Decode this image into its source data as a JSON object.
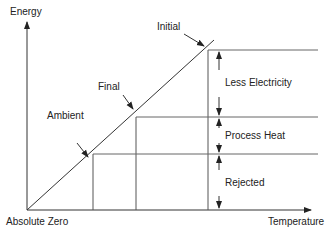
{
  "diagram": {
    "axes": {
      "y_label": "Energy",
      "x_label": "Temperature",
      "origin_label": "Absolute Zero"
    },
    "points": [
      {
        "label": "Initial"
      },
      {
        "label": "Final"
      },
      {
        "label": "Ambient"
      }
    ],
    "bands": [
      {
        "label": "Less Electricity"
      },
      {
        "label": "Process Heat"
      },
      {
        "label": "Rejected"
      }
    ],
    "colors": {
      "line": "#333333",
      "text": "#222222",
      "background": "#ffffff"
    }
  }
}
